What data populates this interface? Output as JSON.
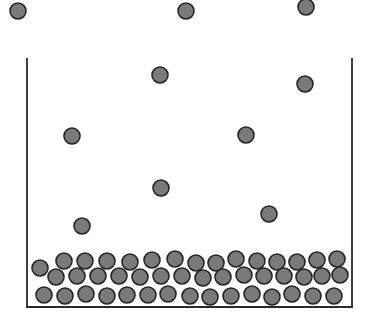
{
  "diagram": {
    "type": "particle-model",
    "colors": {
      "particle_fill": "#7a7a7a",
      "particle_stroke": "#262626",
      "container": "#2a2a2a",
      "background": "#ffffff"
    },
    "particle_radius": 8,
    "container": {
      "left_x": 27,
      "right_x": 352,
      "top_y": 58,
      "bottom_y": 307,
      "open_top": true
    },
    "gas_particles": [
      {
        "x": 18,
        "y": 11
      },
      {
        "x": 186,
        "y": 11
      },
      {
        "x": 306,
        "y": 7
      },
      {
        "x": 160,
        "y": 75
      },
      {
        "x": 305,
        "y": 84
      },
      {
        "x": 72,
        "y": 136
      },
      {
        "x": 246,
        "y": 135
      },
      {
        "x": 161,
        "y": 188
      },
      {
        "x": 269,
        "y": 214
      },
      {
        "x": 82,
        "y": 226
      }
    ],
    "condensed_particles": [
      {
        "x": 40,
        "y": 268
      },
      {
        "x": 64,
        "y": 261
      },
      {
        "x": 85,
        "y": 261
      },
      {
        "x": 107,
        "y": 261
      },
      {
        "x": 130,
        "y": 262
      },
      {
        "x": 152,
        "y": 260
      },
      {
        "x": 175,
        "y": 259
      },
      {
        "x": 196,
        "y": 263
      },
      {
        "x": 216,
        "y": 263
      },
      {
        "x": 236,
        "y": 259
      },
      {
        "x": 257,
        "y": 261
      },
      {
        "x": 277,
        "y": 262
      },
      {
        "x": 297,
        "y": 262
      },
      {
        "x": 317,
        "y": 260
      },
      {
        "x": 337,
        "y": 259
      },
      {
        "x": 56,
        "y": 277
      },
      {
        "x": 77,
        "y": 276
      },
      {
        "x": 98,
        "y": 276
      },
      {
        "x": 119,
        "y": 276
      },
      {
        "x": 140,
        "y": 277
      },
      {
        "x": 161,
        "y": 276
      },
      {
        "x": 182,
        "y": 276
      },
      {
        "x": 203,
        "y": 278
      },
      {
        "x": 223,
        "y": 277
      },
      {
        "x": 244,
        "y": 275
      },
      {
        "x": 264,
        "y": 276
      },
      {
        "x": 284,
        "y": 276
      },
      {
        "x": 304,
        "y": 277
      },
      {
        "x": 322,
        "y": 276
      },
      {
        "x": 340,
        "y": 275
      },
      {
        "x": 44,
        "y": 295
      },
      {
        "x": 65,
        "y": 296
      },
      {
        "x": 86,
        "y": 294
      },
      {
        "x": 107,
        "y": 296
      },
      {
        "x": 127,
        "y": 295
      },
      {
        "x": 148,
        "y": 295
      },
      {
        "x": 168,
        "y": 294
      },
      {
        "x": 190,
        "y": 296
      },
      {
        "x": 210,
        "y": 297
      },
      {
        "x": 231,
        "y": 296
      },
      {
        "x": 252,
        "y": 294
      },
      {
        "x": 272,
        "y": 297
      },
      {
        "x": 292,
        "y": 294
      },
      {
        "x": 313,
        "y": 296
      },
      {
        "x": 334,
        "y": 296
      }
    ]
  }
}
